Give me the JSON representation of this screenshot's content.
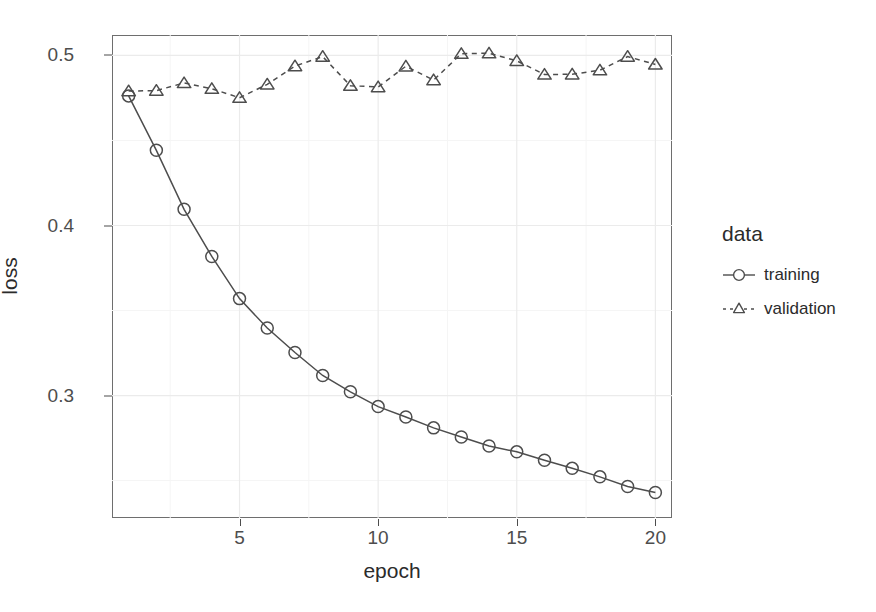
{
  "chart_data": {
    "type": "line",
    "title": "",
    "xlabel": "epoch",
    "ylabel": "loss",
    "xlim": [
      0.4,
      20.6
    ],
    "ylim": [
      0.228,
      0.512
    ],
    "grid": true,
    "legend_position": "right",
    "legend_title": "data",
    "x_ticks": [
      5,
      10,
      15,
      20
    ],
    "x_tick_labels": [
      "5",
      "10",
      "15",
      "20"
    ],
    "y_ticks": [
      0.3,
      0.4,
      0.5
    ],
    "y_tick_labels": [
      "0.3",
      "0.4",
      "0.5"
    ],
    "x": [
      1,
      2,
      3,
      4,
      5,
      6,
      7,
      8,
      9,
      10,
      11,
      12,
      13,
      14,
      15,
      16,
      17,
      18,
      19,
      20
    ],
    "series": [
      {
        "name": "training",
        "marker": "circle",
        "linestyle": "solid",
        "color": "#4d4d4d",
        "values": [
          0.4762,
          0.4442,
          0.4095,
          0.3818,
          0.357,
          0.3397,
          0.3253,
          0.3118,
          0.3022,
          0.2935,
          0.2874,
          0.281,
          0.2756,
          0.2703,
          0.2669,
          0.262,
          0.2572,
          0.2522,
          0.2465,
          0.243
        ]
      },
      {
        "name": "validation",
        "marker": "triangle",
        "linestyle": "dashed",
        "color": "#4d4d4d",
        "values": [
          0.479,
          0.4793,
          0.4838,
          0.4804,
          0.4751,
          0.483,
          0.4937,
          0.4993,
          0.4822,
          0.4814,
          0.4936,
          0.4855,
          0.501,
          0.5013,
          0.4968,
          0.4888,
          0.4889,
          0.4913,
          0.4993,
          0.4947
        ]
      }
    ]
  },
  "axes": {
    "y_title": "loss",
    "x_title": "epoch"
  },
  "legend": {
    "title": "data",
    "entries": [
      {
        "label": "training",
        "marker": "circle-icon",
        "line": "solid-line-icon"
      },
      {
        "label": "validation",
        "marker": "triangle-icon",
        "line": "dashed-line-icon"
      }
    ]
  },
  "colors": {
    "panel_background": "#ffffff",
    "panel_border": "#6e6e6e",
    "grid_major": "#ebebeb",
    "grid_minor": "#f5f5f5",
    "series_ink": "#4d4d4d",
    "text": "#2b2b2b",
    "tick_text": "#4d4d4d"
  }
}
